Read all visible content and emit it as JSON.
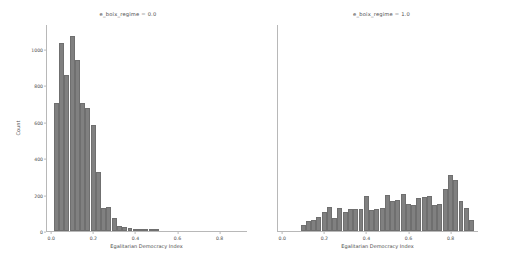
{
  "figure": {
    "width": 507,
    "height": 266,
    "background": "#ffffff",
    "bar_color": "#808080",
    "bar_edge_color": "#6f6f6f",
    "axis_color": "#b8b8b8",
    "text_color": "#4d4d4d"
  },
  "shared": {
    "xlabel": "Egalitarian Democracy Index",
    "ylabel": "Count",
    "xticks": [
      "0.0",
      "0.2",
      "0.4",
      "0.6",
      "0.8"
    ],
    "xtick_values": [
      0.0,
      0.2,
      0.4,
      0.6,
      0.8
    ],
    "yticks": [
      "0",
      "200",
      "400",
      "600",
      "800",
      "1000"
    ],
    "ytick_values": [
      0,
      200,
      400,
      600,
      800,
      1000
    ],
    "xlim": [
      -0.02,
      0.93
    ],
    "ylim": [
      0,
      1130
    ]
  },
  "panels": [
    {
      "title": "e_boix_regime = 0.0",
      "show_yticks": true,
      "show_ylabel": true
    },
    {
      "title": "e_boix_regime = 1.0",
      "show_yticks": false,
      "show_ylabel": false
    }
  ],
  "chart_data": {
    "type": "bar",
    "title": "",
    "xlabel": "Egalitarian Democracy Index",
    "ylabel": "Count",
    "xlim": [
      -0.02,
      0.93
    ],
    "ylim": [
      0,
      1130
    ],
    "grid": false,
    "legend": "none",
    "bin_width": 0.025,
    "facets": [
      {
        "name": "e_boix_regime = 0.0",
        "bin_centers": [
          0.025,
          0.05,
          0.075,
          0.1,
          0.125,
          0.15,
          0.175,
          0.2,
          0.225,
          0.25,
          0.275,
          0.3,
          0.325,
          0.35,
          0.375,
          0.4,
          0.425,
          0.45,
          0.475,
          0.5
        ],
        "values": [
          700,
          1030,
          855,
          1070,
          940,
          700,
          675,
          580,
          325,
          125,
          130,
          70,
          25,
          20,
          15,
          12,
          8,
          5,
          3,
          2
        ]
      },
      {
        "name": "e_boix_regime = 1.0",
        "bin_centers": [
          0.1,
          0.125,
          0.15,
          0.175,
          0.2,
          0.225,
          0.25,
          0.275,
          0.3,
          0.325,
          0.35,
          0.375,
          0.4,
          0.425,
          0.45,
          0.475,
          0.5,
          0.525,
          0.55,
          0.575,
          0.6,
          0.625,
          0.65,
          0.675,
          0.7,
          0.725,
          0.75,
          0.775,
          0.8,
          0.825,
          0.85,
          0.875,
          0.9
        ],
        "values": [
          35,
          55,
          60,
          75,
          105,
          130,
          70,
          125,
          105,
          120,
          120,
          120,
          190,
          115,
          120,
          125,
          200,
          165,
          170,
          205,
          150,
          145,
          180,
          185,
          190,
          145,
          150,
          230,
          310,
          280,
          165,
          125,
          60
        ]
      }
    ]
  }
}
